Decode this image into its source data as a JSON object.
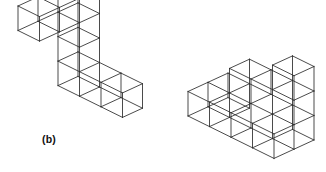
{
  "figure": {
    "label": "(b)",
    "caption_label": "(b)",
    "line_color": "#2b2b2b",
    "background_color": "#ffffff",
    "stroke_width": 0.85,
    "projection": {
      "type": "isometric-wireframe",
      "unit_px": 24.5,
      "x_axis_px": [
        21.5,
        10.6
      ],
      "y_axis_px": [
        20.0,
        -9.2
      ],
      "z_axis_px": [
        0,
        -24.5
      ]
    },
    "objects": [
      {
        "name": "left-polycube",
        "origin_px": [
          18,
          104
        ],
        "cube_count": 8,
        "description": "Z-shaped / staircase polycube: three-cube arm at top going back-right, three-cube vertical column, three-cube arm at bottom going front-right",
        "cubes": [
          [
            0,
            0,
            3
          ],
          [
            0,
            1,
            3
          ],
          [
            0,
            2,
            3
          ],
          [
            0,
            2,
            2
          ],
          [
            0,
            2,
            1
          ],
          [
            0,
            2,
            0
          ],
          [
            1,
            2,
            0
          ],
          [
            2,
            2,
            0
          ]
        ]
      },
      {
        "name": "right-polycube",
        "origin_px": [
          188,
          116
        ],
        "cube_count": 10,
        "description": "Stepped corner solid: four-cube bottom front row, rising three-step staircase at back, two-cube tall tower at right",
        "cubes": [
          [
            0,
            0,
            0
          ],
          [
            1,
            0,
            0
          ],
          [
            2,
            0,
            0
          ],
          [
            3,
            0,
            0
          ],
          [
            0,
            1,
            0
          ],
          [
            3,
            1,
            0
          ],
          [
            3,
            1,
            1
          ],
          [
            2,
            1,
            1
          ],
          [
            1,
            1,
            1
          ],
          [
            3,
            1,
            2
          ]
        ]
      }
    ]
  }
}
